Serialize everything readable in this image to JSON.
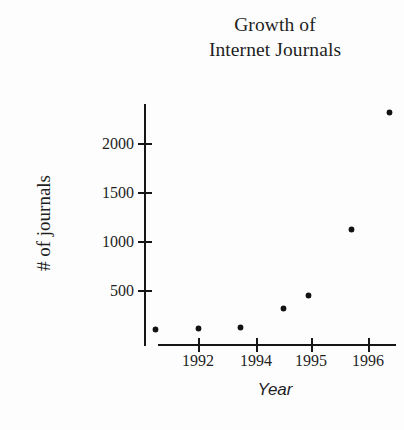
{
  "chart_data": {
    "type": "scatter",
    "title": "Growth of Internet Journals",
    "title_lines": [
      "Growth of",
      "Internet Journals"
    ],
    "xlabel": "Year",
    "ylabel": "# of journals",
    "grid": false,
    "legend": null,
    "xlim": [
      1990.6,
      1996.8
    ],
    "ylim": [
      0,
      2450
    ],
    "x_tick_labels": [
      "1992",
      "1994",
      "1995",
      "1996"
    ],
    "x_tick_values": [
      1992,
      1994,
      1995,
      1996
    ],
    "y_tick_labels": [
      "500",
      "1000",
      "1500",
      "2000"
    ],
    "y_tick_values": [
      500,
      1000,
      1500,
      2000
    ],
    "x": [
      1991.0,
      1992.0,
      1993.0,
      1994.0,
      1994.6,
      1995.6,
      1996.5
    ],
    "values": [
      100,
      110,
      115,
      310,
      440,
      1120,
      2310
    ],
    "points": [
      {
        "x": 1991.0,
        "y": 100
      },
      {
        "x": 1992.0,
        "y": 110
      },
      {
        "x": 1993.0,
        "y": 115
      },
      {
        "x": 1994.0,
        "y": 310
      },
      {
        "x": 1994.6,
        "y": 440
      },
      {
        "x": 1995.6,
        "y": 1120
      },
      {
        "x": 1996.5,
        "y": 2310
      }
    ],
    "marker": "dot",
    "marker_color": "#121212",
    "axis_color": "#151515",
    "background": "#fdfdfd"
  },
  "pixel_layout": {
    "y_ticks_px": [
      290,
      241,
      192,
      143
    ],
    "x_ticks_px": [
      198,
      256,
      311,
      368
    ],
    "points_px": [
      {
        "x": 161,
        "y": 322
      },
      {
        "x": 200,
        "y": 322
      },
      {
        "x": 238,
        "y": 322
      },
      {
        "x": 274,
        "y": 308
      },
      {
        "x": 311,
        "y": 296
      },
      {
        "x": 348,
        "y": 229
      },
      {
        "x": 384,
        "y": 112
      }
    ]
  }
}
